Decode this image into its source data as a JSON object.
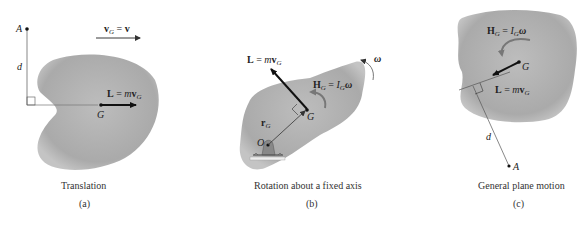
{
  "figure": {
    "panels": [
      {
        "id": "a",
        "caption": "Translation",
        "tag": "(a)",
        "point_label": "A",
        "distance_label": "d",
        "center_label": "G",
        "velocity_label": "v_G = v",
        "momentum_label": "L = m v_G"
      },
      {
        "id": "b",
        "caption": "Rotation about a fixed axis",
        "tag": "(b)",
        "pivot_label": "O",
        "center_label": "G",
        "position_label": "r_G",
        "momentum_label": "L = m v_G",
        "angular_momentum_label": "H_G = I_G ω",
        "angular_velocity_label": "ω"
      },
      {
        "id": "c",
        "caption": "General plane motion",
        "tag": "(c)",
        "point_label": "A",
        "distance_label": "d",
        "center_label": "G",
        "momentum_label": "L = m v_G",
        "angular_momentum_label": "H_G = I_G ω"
      }
    ]
  },
  "colors": {
    "body_fill": "#b3b3b3",
    "body_edge": "#c8c8c8",
    "line": "#555555",
    "arrow": "#111111"
  }
}
